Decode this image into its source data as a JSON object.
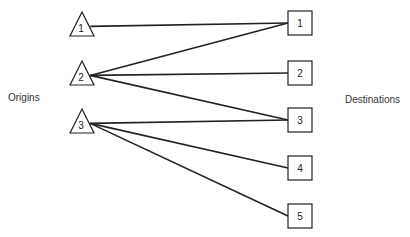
{
  "diagram": {
    "labels": {
      "origins": "Origins",
      "destinations": "Destinations"
    },
    "origins": [
      {
        "id": "1",
        "label": "1",
        "shape": "triangle",
        "apex": [
          82,
          12
        ],
        "base_y": 36,
        "base_x": [
          70,
          94
        ]
      },
      {
        "id": "2",
        "label": "2",
        "shape": "triangle",
        "apex": [
          82,
          61
        ],
        "base_y": 85,
        "base_x": [
          70,
          94
        ]
      },
      {
        "id": "3",
        "label": "3",
        "shape": "triangle",
        "apex": [
          82,
          109
        ],
        "base_y": 133,
        "base_x": [
          70,
          94
        ]
      }
    ],
    "destinations": [
      {
        "id": "1",
        "label": "1",
        "shape": "square",
        "x": 288,
        "y": 11,
        "w": 24,
        "h": 24
      },
      {
        "id": "2",
        "label": "2",
        "shape": "square",
        "x": 288,
        "y": 61,
        "w": 24,
        "h": 24
      },
      {
        "id": "3",
        "label": "3",
        "shape": "square",
        "x": 288,
        "y": 108,
        "w": 24,
        "h": 24
      },
      {
        "id": "4",
        "label": "4",
        "shape": "square",
        "x": 288,
        "y": 156,
        "w": 24,
        "h": 24
      },
      {
        "id": "5",
        "label": "5",
        "shape": "square",
        "x": 288,
        "y": 204,
        "w": 24,
        "h": 24
      }
    ],
    "edges": [
      {
        "from": "1",
        "to": "1"
      },
      {
        "from": "2",
        "to": "1"
      },
      {
        "from": "2",
        "to": "2"
      },
      {
        "from": "2",
        "to": "3"
      },
      {
        "from": "3",
        "to": "3"
      },
      {
        "from": "3",
        "to": "4"
      },
      {
        "from": "3",
        "to": "5"
      }
    ]
  }
}
